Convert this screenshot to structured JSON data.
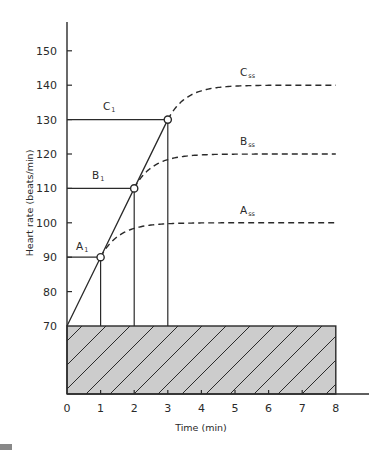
{
  "chart_data": {
    "type": "line",
    "title": "",
    "xlabel": "Time (min)",
    "ylabel": "Heart rate (beats/min)",
    "xlim": [
      0,
      8
    ],
    "ylim": [
      70,
      150
    ],
    "x_ticks": [
      0,
      1,
      2,
      3,
      4,
      5,
      6,
      7,
      8
    ],
    "y_ticks": [
      70,
      80,
      90,
      100,
      110,
      120,
      130,
      140,
      150
    ],
    "grid": false,
    "legend": "none",
    "baseline": {
      "value": 70,
      "from_x": 0,
      "to_x": 8,
      "style": "hatched-gray-box",
      "fill": "#cccccc"
    },
    "ramp": {
      "name": "Linear rise",
      "points": [
        [
          0,
          70
        ],
        [
          1,
          90
        ],
        [
          2,
          110
        ],
        [
          3,
          130
        ]
      ],
      "style": "solid"
    },
    "series": [
      {
        "name": "A",
        "initial_label": "A1",
        "initial_label_main": "A",
        "initial_label_sub": "1",
        "steady_label_main": "A",
        "steady_label_sub": "ss",
        "breakpoint": [
          1,
          90
        ],
        "steady_state": 100,
        "style": "dashed"
      },
      {
        "name": "B",
        "initial_label": "B1",
        "initial_label_main": "B",
        "initial_label_sub": "1",
        "steady_label_main": "B",
        "steady_label_sub": "ss",
        "breakpoint": [
          2,
          110
        ],
        "steady_state": 120,
        "style": "dashed"
      },
      {
        "name": "C",
        "initial_label": "C1",
        "initial_label_main": "C",
        "initial_label_sub": "1",
        "steady_label_main": "C",
        "steady_label_sub": "ss",
        "breakpoint": [
          3,
          130
        ],
        "steady_state": 140,
        "style": "dashed"
      }
    ],
    "annotations": [
      "Horizontal reference lines from y-axis to each breakpoint (90, 110, 130)",
      "Vertical lines from each breakpoint down to baseline 70 (at t=1, 2, 3)",
      "Open circle markers at each breakpoint"
    ]
  },
  "colors": {
    "ink": "#2a2a2a",
    "hatch_fill": "#cccccc",
    "background": "#ffffff"
  }
}
